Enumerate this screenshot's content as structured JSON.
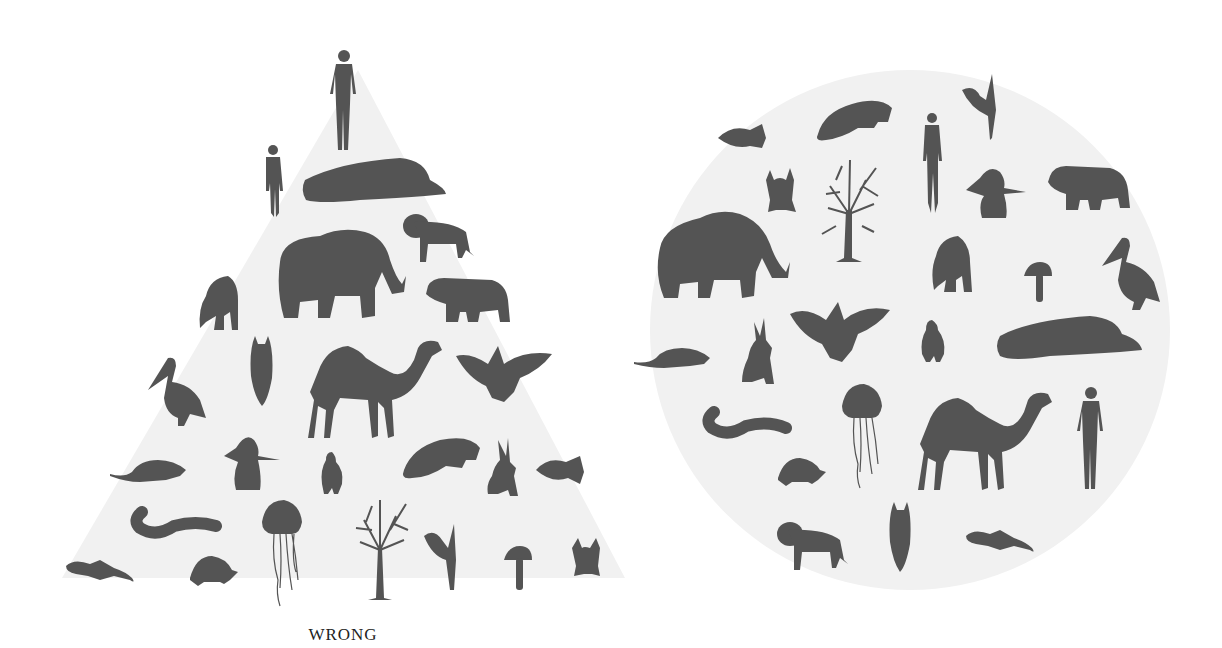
{
  "labels": {
    "wrong": "WRONG",
    "right": "RIGHT"
  },
  "colors": {
    "background": "#ffffff",
    "shape_fill": "#f1f1f1",
    "silhouette": "#545454",
    "label_text": "#222222"
  },
  "left_panel": {
    "shape": "triangle",
    "caption": "WRONG",
    "organisms_top_to_bottom": [
      "man",
      "woman",
      "sperm whale",
      "lion",
      "elephant",
      "gorilla",
      "bear",
      "owl",
      "pelican",
      "camel",
      "eagle",
      "rat",
      "penguin",
      "duck",
      "manatee",
      "hare",
      "clownfish",
      "eel",
      "jellyfish",
      "tree",
      "trillium plant",
      "mushroom",
      "frog",
      "gecko",
      "tortoise"
    ]
  },
  "right_panel": {
    "shape": "circle",
    "caption": "RIGHT",
    "organisms": [
      "clownfish",
      "manatee",
      "woman",
      "trillium plant",
      "frog",
      "tree",
      "penguin",
      "bear",
      "elephant",
      "gorilla",
      "mushroom",
      "pelican",
      "rat",
      "hare",
      "eagle",
      "duck",
      "sperm whale",
      "eel",
      "jellyfish",
      "camel",
      "man",
      "tortoise",
      "lion",
      "owl",
      "gecko"
    ]
  }
}
